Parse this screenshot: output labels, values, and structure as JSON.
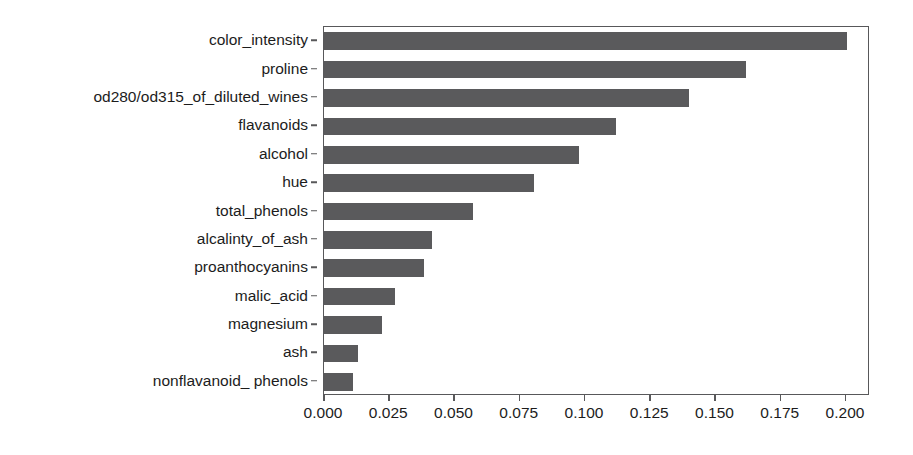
{
  "chart_data": {
    "type": "bar",
    "orientation": "horizontal",
    "title": "",
    "subtitle": "",
    "xlabel": "",
    "ylabel": "",
    "categories": [
      "color_intensity",
      "proline",
      "od280/od315_of_diluted_wines",
      "flavanoids",
      "alcohol",
      "hue",
      "total_phenols",
      "alcalinty_of_ash",
      "proanthocyanins",
      "malic_acid",
      "magnesium",
      "ash",
      "nonflavanoid_ phenols"
    ],
    "values": [
      0.2005,
      0.1615,
      0.14,
      0.1118,
      0.0977,
      0.0805,
      0.0571,
      0.0414,
      0.0383,
      0.0272,
      0.0222,
      0.013,
      0.011
    ],
    "xlim": [
      0.0,
      0.2092
    ],
    "xticks": [
      0.0,
      0.025,
      0.05,
      0.075,
      0.1,
      0.125,
      0.15,
      0.175,
      0.2
    ],
    "xticklabels": [
      "0.000",
      "0.025",
      "0.050",
      "0.075",
      "0.100",
      "0.125",
      "0.150",
      "0.175",
      "0.200"
    ],
    "grid": false,
    "legend": null,
    "legend_position": "none",
    "bar_color": "#5a5a5c",
    "frame_color": "#58585a",
    "background_color": "#ffffff",
    "text_color": "#1c1c1c",
    "annotations": []
  }
}
